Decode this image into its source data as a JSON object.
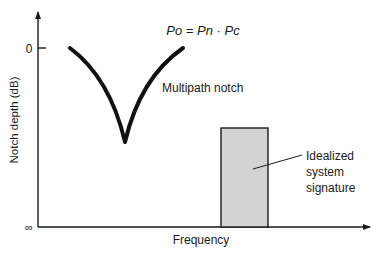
{
  "diagram": {
    "formula": "Po = Pn · Pc",
    "notch_label": "Multipath notch",
    "y_axis": {
      "label": "Notch depth (dB)",
      "tick_top": "0",
      "tick_bottom": "∞"
    },
    "x_axis": {
      "label": "Frequency"
    },
    "signature_label": {
      "line1": "Idealized",
      "line2": "system",
      "line3": "signature"
    },
    "colors": {
      "stroke": "#1a1a1a",
      "bar_fill": "#d3d3d3",
      "background": "#ffffff"
    }
  }
}
